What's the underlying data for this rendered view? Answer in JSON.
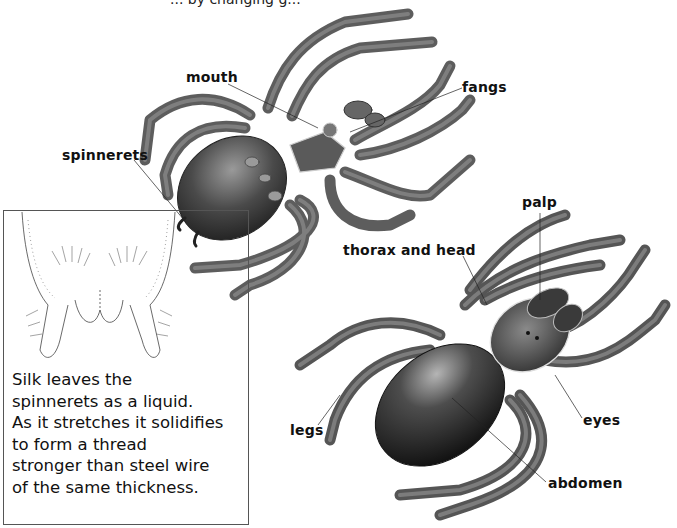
{
  "figure": {
    "title_cropped": "... by changing g...",
    "labels": {
      "mouth": "mouth",
      "fangs": "fangs",
      "spinnerets": "spinnerets",
      "thorax_and_head": "thorax and head",
      "palp": "palp",
      "legs": "legs",
      "eyes": "eyes",
      "abdomen": "abdomen"
    },
    "inset": {
      "caption_lines": [
        "Silk leaves the",
        "spinnerets as a liquid.",
        "As it stretches it solidifies",
        "to form a thread",
        "stronger than steel wire",
        "of the same  thickness."
      ]
    },
    "subjects": {
      "upper_spider": "spider-underside-illustration",
      "lower_spider": "spider-top-view-illustration",
      "inset_image": "spinneret-closeup-drawing"
    }
  }
}
